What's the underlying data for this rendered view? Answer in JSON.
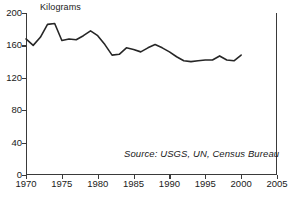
{
  "chart_data": {
    "type": "line",
    "title": "",
    "subtitle": "",
    "ylabel": "Kilograms",
    "xlabel": "",
    "xlim": [
      1970,
      2005
    ],
    "ylim": [
      0,
      200
    ],
    "grid": false,
    "legend": null,
    "annotations": [
      {
        "name": "source-note",
        "text": "Source: USGS, UN, Census Bureau",
        "style": "italic"
      }
    ],
    "yticks": [
      0,
      40,
      80,
      120,
      160,
      200
    ],
    "ytick_labels": [
      "0",
      "40",
      "80",
      "120",
      "160",
      "200"
    ],
    "xticks": [
      1970,
      1975,
      1980,
      1985,
      1990,
      1995,
      2000,
      2005
    ],
    "xtick_labels": [
      "1970",
      "1975",
      "1980",
      "1985",
      "1990",
      "1995",
      "2000",
      "2005"
    ],
    "series": [
      {
        "name": "Kilograms per capita",
        "color": "#262626",
        "x": [
          1970,
          1971,
          1972,
          1973,
          1974,
          1975,
          1976,
          1977,
          1978,
          1979,
          1980,
          1981,
          1982,
          1983,
          1984,
          1985,
          1986,
          1987,
          1988,
          1989,
          1990,
          1991,
          1992,
          1993,
          1994,
          1995,
          1996,
          1997,
          1998,
          1999,
          2000
        ],
        "values": [
          168,
          160,
          170,
          186,
          187,
          166,
          168,
          167,
          172,
          178,
          172,
          161,
          148,
          149,
          157,
          155,
          152,
          157,
          161,
          157,
          152,
          146,
          141,
          140,
          141,
          142,
          142,
          147,
          142,
          141,
          148
        ]
      }
    ]
  }
}
